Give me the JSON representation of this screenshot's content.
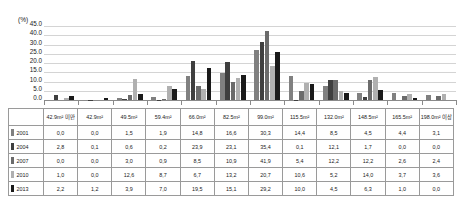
{
  "chart_data": {
    "type": "bar",
    "title": "",
    "xlabel": "",
    "ylabel": "(%)",
    "ylim": [
      0,
      45
    ],
    "grid": true,
    "legend_position": "table-row-headers",
    "yticks": [
      "45.0",
      "40.0",
      "30.0",
      "25.0",
      "20.0",
      "15.0",
      "10.0",
      "5.0",
      "0.0"
    ],
    "ytick_values": [
      45.0,
      40.0,
      35.0,
      30.0,
      25.0,
      20.0,
      15.0,
      10.0,
      5.0,
      0.0
    ],
    "categories": [
      "42.9m² 미만",
      "42.9m²",
      "49.5m²",
      "59.4m²",
      "66.0m²",
      "82.5m²",
      "99.0m²",
      "115.5m²",
      "132.0m²",
      "148.5m²",
      "165.5m²",
      "198.0m² 이상"
    ],
    "series": [
      {
        "name": "2001",
        "color": "#808080",
        "values": [
          0.0,
          0.0,
          1.5,
          1.9,
          14.8,
          16.6,
          30.3,
          14.4,
          8.5,
          4.5,
          4.4,
          3.1
        ]
      },
      {
        "name": "2004",
        "color": "#3f3f3f",
        "values": [
          2.8,
          0.1,
          0.6,
          0.2,
          23.9,
          23.1,
          35.4,
          0.1,
          12.1,
          1.7,
          0.0,
          0.0
        ]
      },
      {
        "name": "2007",
        "color": "#6b6b6b",
        "values": [
          0.0,
          0.0,
          3.0,
          0.9,
          8.5,
          10.9,
          41.9,
          5.4,
          12.2,
          12.2,
          2.6,
          2.4
        ]
      },
      {
        "name": "2010",
        "color": "#b0b0b0",
        "values": [
          1.0,
          0.0,
          12.6,
          8.7,
          6.7,
          13.2,
          20.7,
          10.6,
          5.2,
          14.0,
          3.7,
          3.6
        ]
      },
      {
        "name": "2013",
        "color": "#1a1a1a",
        "values": [
          2.2,
          1.2,
          3.9,
          7.0,
          19.5,
          15.1,
          29.2,
          10.0,
          4.5,
          6.3,
          1.0,
          0.0
        ]
      }
    ]
  },
  "table": {
    "corner_header": "",
    "column_headers": [
      "42.9m² 미만",
      "42.9m²",
      "49.5m²",
      "59.4m²",
      "66.0m²",
      "82.5m²",
      "99.0m²",
      "115.5m²",
      "132.0m²",
      "148.5m²",
      "165.5m²",
      "198.0m² 이상"
    ],
    "rows": [
      {
        "year": "2001",
        "swatch": "#808080",
        "values": [
          "0,0",
          "0,0",
          "1,5",
          "1,9",
          "14,8",
          "16,6",
          "30,3",
          "14,4",
          "8,5",
          "4,5",
          "4,4",
          "3,1"
        ]
      },
      {
        "year": "2004",
        "swatch": "#3f3f3f",
        "values": [
          "2,8",
          "0,1",
          "0,6",
          "0,2",
          "23,9",
          "23,1",
          "35,4",
          "0,1",
          "12,1",
          "1,7",
          "0,0",
          "0,0"
        ]
      },
      {
        "year": "2007",
        "swatch": "#6b6b6b",
        "values": [
          "0,0",
          "0,0",
          "3,0",
          "0,9",
          "8,5",
          "10,9",
          "41,9",
          "5,4",
          "12,2",
          "12,2",
          "2,6",
          "2,4"
        ]
      },
      {
        "year": "2010",
        "swatch": "#b0b0b0",
        "values": [
          "1,0",
          "0,0",
          "12,6",
          "8,7",
          "6,7",
          "13,2",
          "20,7",
          "10,6",
          "5,2",
          "14,0",
          "3,7",
          "3,6"
        ]
      },
      {
        "year": "2013",
        "swatch": "#1a1a1a",
        "values": [
          "2,2",
          "1,2",
          "3,9",
          "7,0",
          "19,5",
          "15,1",
          "29,2",
          "10,0",
          "4,5",
          "6,3",
          "1,0",
          "0,0"
        ]
      }
    ]
  }
}
